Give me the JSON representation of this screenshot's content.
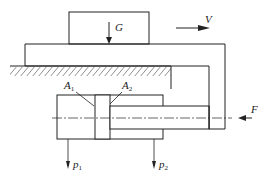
{
  "diagram": {
    "type": "hydraulic cylinder driving worktable",
    "labels": {
      "load": "G",
      "velocity": "V",
      "force": "F",
      "area1": "A",
      "area1_sub": "1",
      "area2": "A",
      "area2_sub": "2",
      "pressure1": "p",
      "pressure1_sub": "1",
      "pressure2": "p",
      "pressure2_sub": "2"
    },
    "colors": {
      "line": "#222222",
      "background": "#ffffff"
    }
  }
}
